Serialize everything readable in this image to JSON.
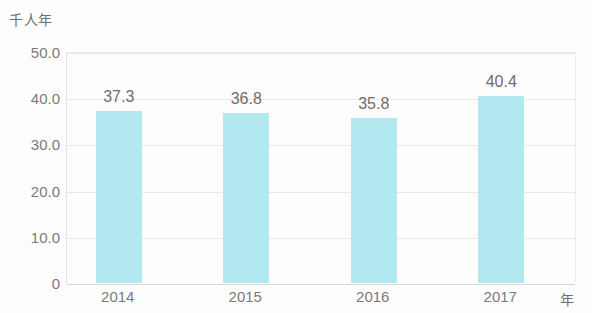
{
  "chart_data": {
    "type": "bar",
    "title": "",
    "subtitle": "",
    "xlabel": "年",
    "ylabel": "千人年",
    "categories": [
      "2014",
      "2015",
      "2016",
      "2017"
    ],
    "values": [
      37.3,
      36.8,
      35.8,
      40.4
    ],
    "value_labels": [
      "37.3",
      "36.8",
      "35.8",
      "40.4"
    ],
    "series": [
      {
        "name": "",
        "values": [
          37.3,
          36.8,
          35.8,
          40.4
        ]
      }
    ],
    "ylim": [
      0,
      50
    ],
    "ytick_values": [
      0,
      10,
      20,
      30,
      40,
      50
    ],
    "ytick_labels": [
      "0",
      "10.0",
      "20.0",
      "30.0",
      "40.0",
      "50.0"
    ],
    "grid": true,
    "grid_axis": "y",
    "legend": false,
    "legend_position": "none",
    "bar_color": "#b2e8ef",
    "gridline_color": "#e8e8e8",
    "text_color": "#6d6d6d",
    "axis_text_color": "#7a7a7a",
    "background_color": "#fdfdfd"
  }
}
